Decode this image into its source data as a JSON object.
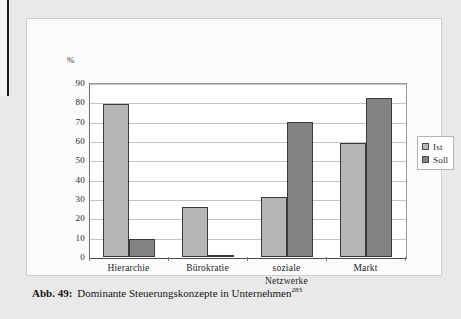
{
  "figure": {
    "axis_unit_label": "%",
    "caption_label": "Abb. 49:",
    "caption_text": "Dominante Steuerungskonzepte in Unternehmen",
    "caption_footnote": "283"
  },
  "legend": {
    "position": "right",
    "entries": [
      {
        "label": "Ist",
        "color": "#b6b6b6"
      },
      {
        "label": "Soll",
        "color": "#838383"
      }
    ]
  },
  "chart_data": {
    "type": "bar",
    "title": "Dominante Steuerungskonzepte in Unternehmen",
    "xlabel": "",
    "ylabel": "%",
    "ylim": [
      0,
      90
    ],
    "yticks": [
      0,
      10,
      20,
      30,
      40,
      50,
      60,
      70,
      80,
      90
    ],
    "ytick_labels": [
      "0",
      "10",
      "20",
      "30",
      "40",
      "50",
      "60",
      "70",
      "80",
      "90"
    ],
    "grid": true,
    "legend_position": "right",
    "categories": [
      "Hierarchie",
      "Bürokratie",
      "soziale Netzwerke",
      "Markt"
    ],
    "category_lines": [
      [
        "Hierarchie"
      ],
      [
        "Bürokratie"
      ],
      [
        "soziale",
        "Netzwerke"
      ],
      [
        "Markt"
      ]
    ],
    "series": [
      {
        "name": "Ist",
        "color": "#b6b6b6",
        "values": [
          79,
          26,
          31,
          59
        ]
      },
      {
        "name": "Soll",
        "color": "#838383",
        "values": [
          9.5,
          1,
          70,
          82
        ]
      }
    ]
  }
}
